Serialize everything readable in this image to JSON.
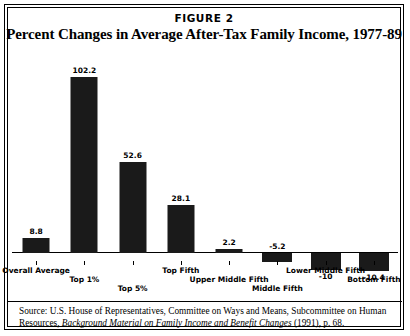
{
  "figure": {
    "label": "FIGURE 2",
    "title": "Percent Changes in Average After-Tax Family Income, 1977-89"
  },
  "source": {
    "lead": "Source: U.S. House of Representatives, Committee on Ways and Means, Subcommittee on Human Resources, ",
    "italic": "Background Material on Family Income and Benefit Changes",
    "tail": " (1991), p. 68."
  },
  "chart_data": {
    "type": "bar",
    "title": "Percent Changes in Average After-Tax Family Income, 1977-89",
    "xlabel": "",
    "ylabel": "",
    "ylim": [
      -20,
      110
    ],
    "grid": false,
    "legend": "none",
    "categories": [
      "Overall Average",
      "Top 1%",
      "Top 5%",
      "Top Fifth",
      "Upper Middle Fifth",
      "Middle Fifth",
      "Lower Middle Fifth",
      "Bottom Fifth"
    ],
    "values": [
      8.8,
      102.2,
      52.6,
      28.1,
      2.2,
      -5.2,
      -10,
      -10.4
    ],
    "value_labels": [
      "8.8",
      "102.2",
      "52.6",
      "28.1",
      "2.2",
      "-5.2",
      "-10",
      "-10.4"
    ],
    "label_positions": [
      "above",
      "above",
      "above",
      "above",
      "above",
      "above",
      "below",
      "below"
    ],
    "category_label_rows": [
      0,
      1,
      2,
      0,
      1,
      2,
      0,
      1
    ],
    "bar_color": "#1a1a1a"
  }
}
